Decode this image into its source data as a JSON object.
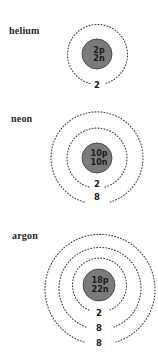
{
  "atoms": [
    {
      "name": "helium",
      "nucleus": {
        "protons": "2p",
        "neutrons": "2n"
      },
      "shells": [
        "2"
      ]
    },
    {
      "name": "neon",
      "nucleus": {
        "protons": "10p",
        "neutrons": "10n"
      },
      "shells": [
        "2",
        "8"
      ]
    },
    {
      "name": "argon",
      "nucleus": {
        "protons": "18p",
        "neutrons": "22n"
      },
      "shells": [
        "2",
        "8",
        "8"
      ]
    }
  ],
  "colors": {
    "nucleus_fill": "#7b7b7b",
    "orbit_dots": "#444444",
    "text": "#1c1c1c"
  }
}
